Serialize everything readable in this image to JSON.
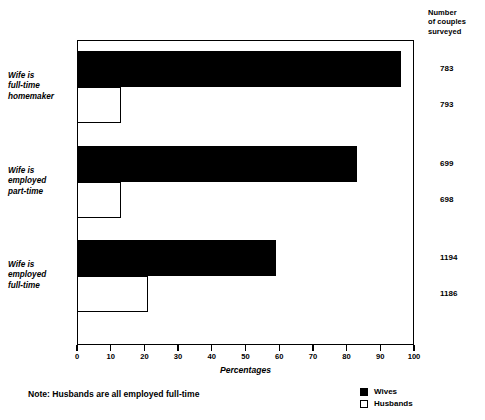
{
  "chart_data": {
    "type": "bar",
    "orientation": "horizontal",
    "title": "",
    "xlabel": "Percentages",
    "ylabel": "",
    "xlim": [
      0,
      100
    ],
    "xticks": [
      0,
      10,
      20,
      30,
      40,
      50,
      60,
      70,
      80,
      90,
      100
    ],
    "grid": false,
    "legend_position": "bottom-right",
    "categories": [
      "Wife is full-time homemaker",
      "Wife is employed part-time",
      "Wife is employed full-time"
    ],
    "series": [
      {
        "name": "Wives",
        "values": [
          96,
          83,
          59
        ],
        "color": "#000000"
      },
      {
        "name": "Husbands",
        "values": [
          13,
          13,
          21
        ],
        "color": "#ffffff"
      }
    ],
    "annotations": {
      "note": "Note: Husbands are all employed full-time",
      "right_axis_header": "Number of couples surveyed"
    }
  },
  "right_header": {
    "line1": "Number",
    "line2": "of couples",
    "line3": "surveyed"
  },
  "categories": [
    {
      "id": "full-time-homemaker",
      "label_lines": [
        "Wife is",
        "full-time",
        "homemaker"
      ],
      "wives_pct": 96,
      "husbands_pct": 13,
      "wives_count": "783",
      "husbands_count": "793"
    },
    {
      "id": "employed-part-time",
      "label_lines": [
        "Wife is",
        "employed",
        "part-time"
      ],
      "wives_pct": 83,
      "husbands_pct": 13,
      "wives_count": "699",
      "husbands_count": "698"
    },
    {
      "id": "employed-full-time",
      "label_lines": [
        "Wife is",
        "employed",
        "full-time"
      ],
      "wives_pct": 59,
      "husbands_pct": 21,
      "wives_count": "1194",
      "husbands_count": "1186"
    }
  ],
  "axis": {
    "title": "Percentages",
    "ticks": [
      "0",
      "10",
      "20",
      "30",
      "40",
      "50",
      "60",
      "70",
      "80",
      "90",
      "100"
    ]
  },
  "legend": {
    "items": [
      {
        "label": "Wives",
        "swatch": "filled-square"
      },
      {
        "label": "Husbands",
        "swatch": "hollow-square"
      }
    ]
  },
  "note": "Note: Husbands are all employed full-time"
}
